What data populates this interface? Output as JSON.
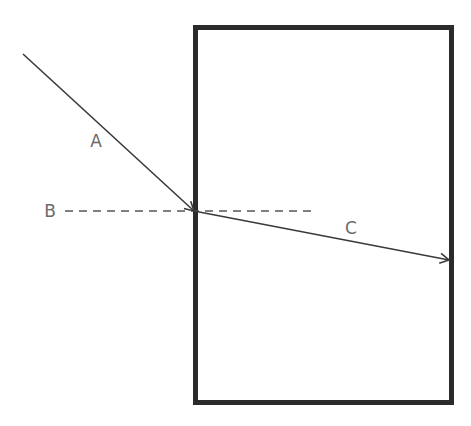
{
  "diagram": {
    "type": "refraction",
    "colors": {
      "block_border": "#2b2b2b",
      "ray": "#3a3a3a",
      "normal": "#555555",
      "label": "#6a6a6a",
      "background": "#ffffff"
    },
    "block": {
      "x": 193,
      "y": 25,
      "width": 261,
      "height": 380,
      "stroke_width": 5
    },
    "incidence_point": {
      "x": 194,
      "y": 211
    },
    "rays": [
      {
        "id": "A",
        "label": "A",
        "from": [
          23,
          54
        ],
        "to": [
          194,
          211
        ],
        "arrow": true,
        "label_pos": [
          96,
          147
        ]
      },
      {
        "id": "C",
        "label": "C",
        "from": [
          194,
          211
        ],
        "to": [
          449,
          260
        ],
        "arrow": true,
        "label_pos": [
          351,
          234
        ]
      }
    ],
    "normal": {
      "id": "B",
      "label": "B",
      "from": [
        65,
        211
      ],
      "to": [
        316,
        211
      ],
      "dashed": true,
      "label_pos": [
        50,
        217
      ]
    }
  }
}
